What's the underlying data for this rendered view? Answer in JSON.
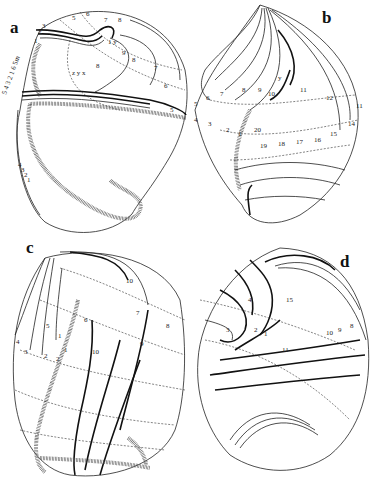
{
  "figure": {
    "panels": [
      {
        "id": "a",
        "label": "a",
        "numbers": [
          "1",
          "2",
          "3",
          "5",
          "6",
          "7",
          "8",
          "1",
          "y",
          "9",
          "8",
          "7",
          "6",
          "5",
          "z",
          "y",
          "x",
          "8",
          "1",
          "2",
          "3",
          "4",
          "1",
          "2",
          "3",
          "4",
          "5",
          "6",
          "7",
          "8"
        ]
      },
      {
        "id": "b",
        "label": "b",
        "numbers": [
          "5",
          "6",
          "7",
          "8",
          "9",
          "10",
          "11",
          "12",
          "11",
          "4",
          "3",
          "2",
          "1",
          "20",
          "19",
          "18",
          "17",
          "16",
          "15",
          "14",
          "y"
        ]
      },
      {
        "id": "c",
        "label": "c",
        "numbers": [
          "10",
          "7",
          "8",
          "6",
          "5",
          "1",
          "4",
          "3",
          "2",
          "2",
          "1",
          "10",
          "9"
        ]
      },
      {
        "id": "d",
        "label": "d",
        "numbers": [
          "4",
          "3",
          "2",
          "1",
          "11",
          "15",
          "10",
          "9",
          "8"
        ]
      }
    ]
  }
}
